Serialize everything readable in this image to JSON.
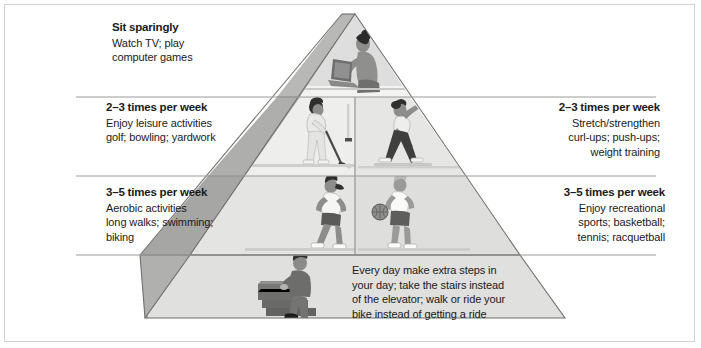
{
  "figure": {
    "type": "activity-pyramid-infographic",
    "colors": {
      "background": "#ffffff",
      "frame_border": "#d2d2d2",
      "text": "#1a1a1a",
      "pyramid_front_light": "#e8e8e6",
      "pyramid_front_mid": "#dcdcda",
      "pyramid_side_dark": "#a8a8a6",
      "pyramid_side_mid": "#bdbdbb",
      "divider_line": "#9a9a9a",
      "outline": "#6e6e6e"
    }
  },
  "tiers": {
    "top": {
      "heading": "Sit sparingly",
      "lines": [
        "Watch TV; play",
        "computer games"
      ],
      "align": "left",
      "illustration": "person-on-laptop"
    },
    "middle_left": {
      "heading": "2–3 times per week",
      "lines": [
        "Enjoy leisure activities",
        "golf; bowling; yardwork"
      ],
      "align": "left",
      "illustration": "golfer"
    },
    "middle_right": {
      "heading": "2–3 times per week",
      "lines": [
        "Stretch/strengthen",
        "curl-ups; push-ups;",
        "weight training"
      ],
      "align": "right",
      "illustration": "stretching-person"
    },
    "lower_left": {
      "heading": "3–5 times per week",
      "lines": [
        "Aerobic activities",
        "long walks; swimming;",
        "biking"
      ],
      "align": "left",
      "illustration": "jogger"
    },
    "lower_right": {
      "heading": "3–5 times per week",
      "lines": [
        "Enjoy recreational",
        "sports; basketball;",
        "tennis; racquetball"
      ],
      "align": "right",
      "illustration": "basketball-player"
    },
    "base": {
      "heading": "",
      "lines": [
        "Every day make extra steps in",
        "your day; take the stairs instead",
        "of the elevator; walk or ride your",
        "bike instead of getting a ride"
      ],
      "align": "left",
      "illustration": "man-climbing-stairs"
    }
  }
}
